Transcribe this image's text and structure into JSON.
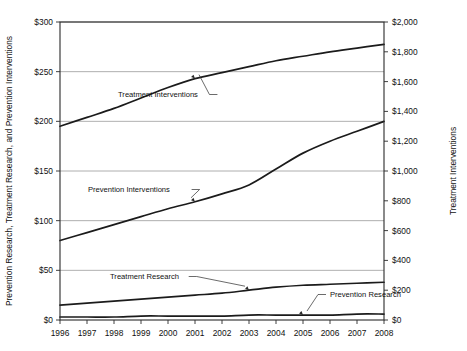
{
  "chart_data": {
    "type": "line",
    "title": "",
    "xlabel": "",
    "ylabel": "Prevention Research, Treatment Research, and Prevention Interventions",
    "y2label": "Treatment Interventions",
    "x": [
      1996,
      1997,
      1998,
      1999,
      2000,
      2001,
      2002,
      2003,
      2004,
      2005,
      2006,
      2007,
      2008
    ],
    "xtick_labels": [
      "1996",
      "1997",
      "1998",
      "1999",
      "2000",
      "2001",
      "2002",
      "2003",
      "2004",
      "2005",
      "2006",
      "2007",
      "2008"
    ],
    "xlim": [
      1996,
      2008
    ],
    "ylim": [
      0,
      300
    ],
    "ytick_labels": [
      "$0",
      "$50",
      "$100",
      "$150",
      "$200",
      "$250",
      "$300"
    ],
    "ytick_values": [
      0,
      50,
      100,
      150,
      200,
      250,
      300
    ],
    "y2lim": [
      0,
      2000
    ],
    "y2tick_labels": [
      "$0",
      "$200",
      "$400",
      "$600",
      "$800",
      "$1,000",
      "$1,200",
      "$1,400",
      "$1,600",
      "$1,800",
      "$2,000"
    ],
    "y2tick_values": [
      0,
      200,
      400,
      600,
      800,
      1000,
      1200,
      1400,
      1600,
      1800,
      2000
    ],
    "grid": true,
    "legend": "inline-annotations",
    "series": [
      {
        "name": "Treatment Interventions",
        "axis": "right",
        "values": [
          1300,
          1360,
          1420,
          1490,
          1560,
          1620,
          1660,
          1700,
          1740,
          1770,
          1800,
          1825,
          1850
        ]
      },
      {
        "name": "Prevention Interventions",
        "axis": "left",
        "values": [
          80,
          88,
          96,
          104,
          112,
          119,
          127,
          136,
          152,
          168,
          180,
          190,
          200
        ]
      },
      {
        "name": "Treatment Research",
        "axis": "left",
        "values": [
          15,
          17,
          19,
          21,
          23,
          25,
          27,
          30,
          33,
          35,
          36,
          37,
          38
        ]
      },
      {
        "name": "Prevention Research",
        "axis": "left",
        "values": [
          3,
          3,
          3,
          4,
          4,
          4,
          4,
          5,
          5,
          5,
          5,
          6,
          6
        ]
      }
    ],
    "annotations": [
      {
        "text": "Treatment Interventions",
        "target_series": "Treatment Interventions",
        "target_year": 2001
      },
      {
        "text": "Prevention Interventions",
        "target_series": "Prevention Interventions",
        "target_year": 2001
      },
      {
        "text": "Treatment Research",
        "target_series": "Treatment Research",
        "target_year": 2003
      },
      {
        "text": "Prevention Research",
        "target_series": "Prevention Research",
        "target_year": 2005
      }
    ]
  }
}
